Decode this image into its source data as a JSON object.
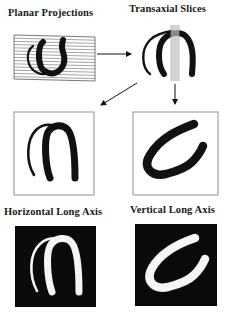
{
  "labels": {
    "planar": "Planar Projections",
    "transaxial": "Transaxial Slices",
    "horizontal": "Horizontal Long Axis",
    "vertical": "Vertical Long Axis"
  },
  "colors": {
    "ink": "#111111",
    "paper": "#ffffff",
    "frame": "#777777",
    "slice_lines": "#9a9a9a"
  },
  "panels": [
    {
      "id": "planar-projection",
      "style": "lined-box",
      "shape": "left-ventricle-u"
    },
    {
      "id": "transaxial-slice",
      "style": "open",
      "shape": "left-ventricle-arch-with-slice-lines"
    },
    {
      "id": "horizontal-long-axis-outline",
      "style": "bordered-white",
      "shape": "inverted-u"
    },
    {
      "id": "vertical-long-axis-outline",
      "style": "bordered-white",
      "shape": "c-shape"
    },
    {
      "id": "horizontal-long-axis-image",
      "style": "black-box",
      "shape": "inverted-u"
    },
    {
      "id": "vertical-long-axis-image",
      "style": "black-box",
      "shape": "c-shape"
    }
  ],
  "arrows": [
    {
      "from": "planar-projection",
      "to": "transaxial-slice",
      "direction": "right"
    },
    {
      "from": "transaxial-slice",
      "to": "horizontal-long-axis-outline",
      "direction": "down-left"
    },
    {
      "from": "transaxial-slice",
      "to": "vertical-long-axis-outline",
      "direction": "down"
    }
  ]
}
